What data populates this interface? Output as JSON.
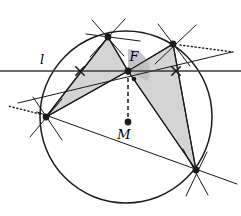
{
  "figure": {
    "width": 241,
    "height": 216,
    "background": "#ffffff"
  },
  "style": {
    "stroke": "#1a1a1a",
    "shade_fill": "#d4d4d4",
    "shade_stroke": "#1a1a1a",
    "angle_fill": "#bfbfbf",
    "line_width": 1.3,
    "thin_width": 1.0,
    "dot_radius": 3.4
  },
  "labels": {
    "line_l": "l",
    "point_F": "F",
    "point_M": "M"
  },
  "label_positions": {
    "line_l": {
      "x": 42,
      "y": 64
    },
    "point_F": {
      "x": 134,
      "y": 61
    },
    "point_M": {
      "x": 124,
      "y": 139
    }
  },
  "circle": {
    "cx": 126,
    "cy": 117,
    "r": 86
  },
  "points": {
    "A_top": {
      "x": 108,
      "y": 37,
      "dot": true,
      "label": ""
    },
    "B_upper_right": {
      "x": 173,
      "y": 44,
      "dot": true,
      "label": ""
    },
    "C_lower_right": {
      "x": 196,
      "y": 170,
      "dot": true,
      "label": ""
    },
    "D_left": {
      "x": 46,
      "y": 117,
      "dot": true,
      "label": ""
    },
    "F": {
      "x": 128,
      "y": 71,
      "dot": true,
      "label": "F"
    },
    "M": {
      "x": 128,
      "y": 122,
      "dot": true,
      "label": "M"
    },
    "X_left_mark": {
      "x": 80,
      "y": 71,
      "dot": false,
      "label": ""
    },
    "X_right_mark": {
      "x": 176,
      "y": 71,
      "dot": false,
      "label": ""
    }
  },
  "line_l": {
    "x1": 0,
    "y1": 71,
    "x2": 241,
    "y2": 71
  },
  "shaded_triangles": [
    {
      "name": "left-triangle",
      "vertices": [
        {
          "x": 108,
          "y": 37
        },
        {
          "x": 46,
          "y": 117
        },
        {
          "x": 128,
          "y": 71
        }
      ]
    },
    {
      "name": "right-triangle",
      "vertices": [
        {
          "x": 128,
          "y": 71
        },
        {
          "x": 173,
          "y": 44
        },
        {
          "x": 196,
          "y": 170
        }
      ]
    }
  ],
  "chords": [
    {
      "name": "chord-top-left",
      "x1": 108,
      "y1": 37,
      "x2": 46,
      "y2": 117
    },
    {
      "name": "chord-top-F",
      "x1": 108,
      "y1": 37,
      "x2": 128,
      "y2": 71
    },
    {
      "name": "chord-F-left",
      "x1": 128,
      "y1": 71,
      "x2": 46,
      "y2": 117
    },
    {
      "name": "chord-F-upper-right",
      "x1": 128,
      "y1": 71,
      "x2": 173,
      "y2": 44
    },
    {
      "name": "chord-F-lower-right",
      "x1": 128,
      "y1": 71,
      "x2": 196,
      "y2": 170
    },
    {
      "name": "chord-upper-lower-right",
      "x1": 173,
      "y1": 44,
      "x2": 196,
      "y2": 170
    }
  ],
  "long_lines": [
    {
      "name": "line-left-to-upper-right",
      "x1": 18,
      "y1": 103,
      "x2": 232,
      "y2": 52
    },
    {
      "name": "line-left-to-lower-right",
      "x1": 37,
      "y1": 112,
      "x2": 237,
      "y2": 184
    },
    {
      "name": "line-top-through-circle",
      "x1": 92,
      "y1": 20,
      "x2": 124,
      "y2": 56
    },
    {
      "name": "line-top-fan-a",
      "x1": 125,
      "y1": 19,
      "x2": 90,
      "y2": 57
    },
    {
      "name": "line-top-fan-b",
      "x1": 86,
      "y1": 34,
      "x2": 140,
      "y2": 41
    },
    {
      "name": "line-upr-fan-a",
      "x1": 158,
      "y1": 24,
      "x2": 190,
      "y2": 66
    },
    {
      "name": "line-upr-fan-b",
      "x1": 196,
      "y1": 25,
      "x2": 155,
      "y2": 64
    },
    {
      "name": "line-lowr-fan-a",
      "x1": 183,
      "y1": 149,
      "x2": 208,
      "y2": 195
    },
    {
      "name": "line-lowr-fan-b",
      "x1": 207,
      "y1": 152,
      "x2": 186,
      "y2": 196
    },
    {
      "name": "line-left-fan-a",
      "x1": 33,
      "y1": 97,
      "x2": 62,
      "y2": 140
    },
    {
      "name": "line-left-fan-b",
      "x1": 62,
      "y1": 99,
      "x2": 30,
      "y2": 137
    }
  ],
  "dotted_rays": [
    {
      "name": "dotted-ray-right",
      "x1": 180,
      "y1": 45,
      "x2": 233,
      "y2": 52
    },
    {
      "name": "dotted-ray-left",
      "x1": 40,
      "y1": 114,
      "x2": 8,
      "y2": 106
    }
  ],
  "dashed_segment": {
    "name": "segment-F-M",
    "x1": 128,
    "y1": 71,
    "x2": 128,
    "y2": 122
  },
  "angle_marker": {
    "name": "angle-at-F",
    "cx": 128,
    "cy": 71,
    "r": 22,
    "start_deg": -90,
    "end_deg": 28,
    "vertex_dot": {
      "x": 134,
      "y": 79
    }
  }
}
